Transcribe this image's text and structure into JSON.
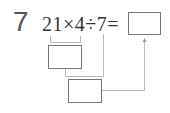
{
  "problem": {
    "number": "7",
    "expression": "21×4÷7=",
    "answer_box_value": "",
    "step1_box_value": "",
    "step2_box_value": ""
  }
}
